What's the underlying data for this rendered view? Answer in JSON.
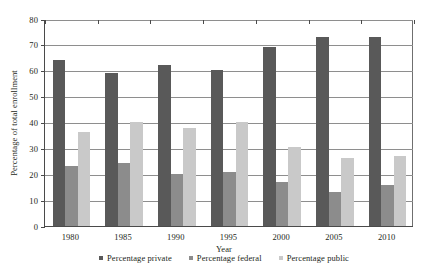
{
  "chart_data": {
    "type": "bar",
    "title": "",
    "xlabel": "Year",
    "ylabel": "Percentage of total enrollment",
    "categories": [
      "1980",
      "1985",
      "1990",
      "1995",
      "2000",
      "2005",
      "2010"
    ],
    "ylim": [
      0,
      80
    ],
    "yticks": [
      0,
      10,
      20,
      30,
      40,
      50,
      60,
      70,
      80
    ],
    "ytick_labels": [
      "0",
      "10",
      "20",
      "30",
      "40",
      "50",
      "60",
      "70",
      "80"
    ],
    "grid": true,
    "legend_position": "bottom",
    "series": [
      {
        "name": "Percentage private",
        "color": "#595959",
        "values": [
          64,
          59,
          62,
          60,
          69,
          73,
          73
        ]
      },
      {
        "name": "Percentage federal",
        "color": "#8c8c8c",
        "values": [
          23,
          24,
          20,
          20.5,
          17,
          13,
          15.5
        ]
      },
      {
        "name": "Percentage public",
        "color": "#c9c9c9",
        "values": [
          36,
          40,
          37.5,
          40,
          30.5,
          26,
          27
        ]
      }
    ]
  }
}
